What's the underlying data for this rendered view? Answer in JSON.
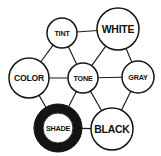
{
  "diagram": {
    "background_color": "#ffffff",
    "stroke_color": "#161616",
    "highlight_fill": "#141414",
    "node_fill": "#ffffff",
    "nodes": [
      {
        "id": "tint",
        "label": "TINT",
        "cx": 62,
        "cy": 33,
        "r": 15,
        "size": "sm",
        "highlighted": false
      },
      {
        "id": "white",
        "label": "WHITE",
        "cx": 118,
        "cy": 29,
        "r": 21,
        "size": "lg",
        "highlighted": false
      },
      {
        "id": "color",
        "label": "COLOR",
        "cx": 29,
        "cy": 78,
        "r": 20,
        "size": "md",
        "highlighted": false
      },
      {
        "id": "tone",
        "label": "TONE",
        "cx": 83,
        "cy": 78,
        "r": 15,
        "size": "sm",
        "highlighted": false
      },
      {
        "id": "gray",
        "label": "GRAY",
        "cx": 138,
        "cy": 77,
        "r": 16,
        "size": "sm",
        "highlighted": false
      },
      {
        "id": "shade",
        "label": "SHADE",
        "cx": 58,
        "cy": 128,
        "r": 24,
        "inner_r": 15,
        "size": "sm",
        "highlighted": true
      },
      {
        "id": "black",
        "label": "BLACK",
        "cx": 112,
        "cy": 129,
        "r": 21,
        "size": "lg",
        "highlighted": false
      }
    ],
    "edges": [
      {
        "from": "tint",
        "to": "color"
      },
      {
        "from": "tint",
        "to": "tone"
      },
      {
        "from": "tint",
        "to": "white"
      },
      {
        "from": "color",
        "to": "tone"
      },
      {
        "from": "color",
        "to": "shade"
      },
      {
        "from": "white",
        "to": "tone"
      },
      {
        "from": "white",
        "to": "gray"
      },
      {
        "from": "tone",
        "to": "gray"
      },
      {
        "from": "tone",
        "to": "shade"
      },
      {
        "from": "tone",
        "to": "black"
      },
      {
        "from": "gray",
        "to": "black"
      },
      {
        "from": "shade",
        "to": "black"
      }
    ]
  }
}
